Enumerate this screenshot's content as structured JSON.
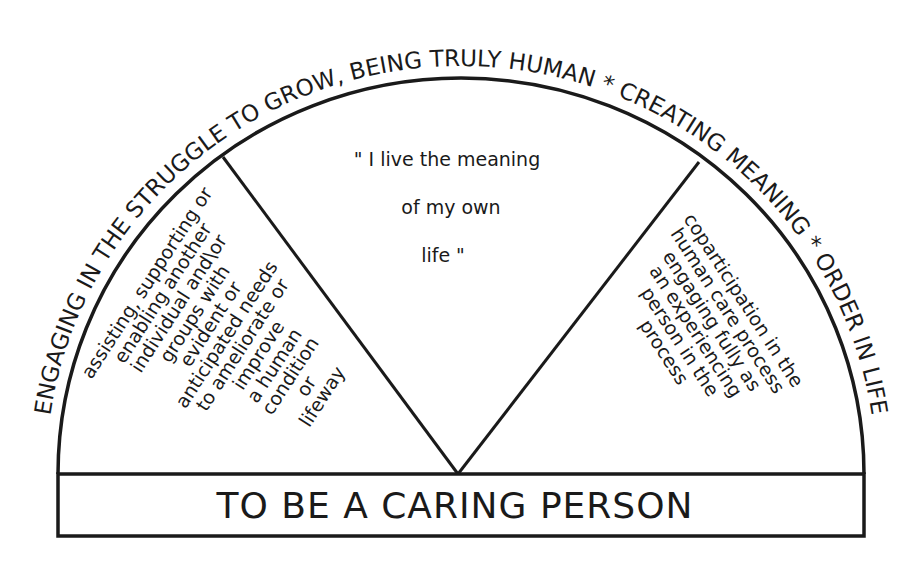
{
  "diagram": {
    "arc_label": "ENGAGING IN THE STRUGGLE TO GROW, BEING TRULY HUMAN * CREATING MEANING * ORDER IN LIFE",
    "center_quote": {
      "lines": [
        "\" I live the meaning",
        "of my own",
        "life \""
      ]
    },
    "left_wedge": {
      "lines": [
        "assisting, supporting or",
        "enabling another",
        "individual and\\or",
        "groups with",
        "evident or",
        "anticipated needs",
        "to ameliorate or",
        "improve",
        "a human",
        "condition",
        "or",
        "lifeway"
      ]
    },
    "right_wedge": {
      "lines": [
        "coparticipation in the",
        "human care process",
        "engaging fully as",
        "an experiencing",
        "person in the",
        "process"
      ]
    },
    "base_label": "TO BE A CARING PERSON",
    "colors": {
      "ink": "#1a1a1a",
      "background": "#ffffff"
    }
  }
}
